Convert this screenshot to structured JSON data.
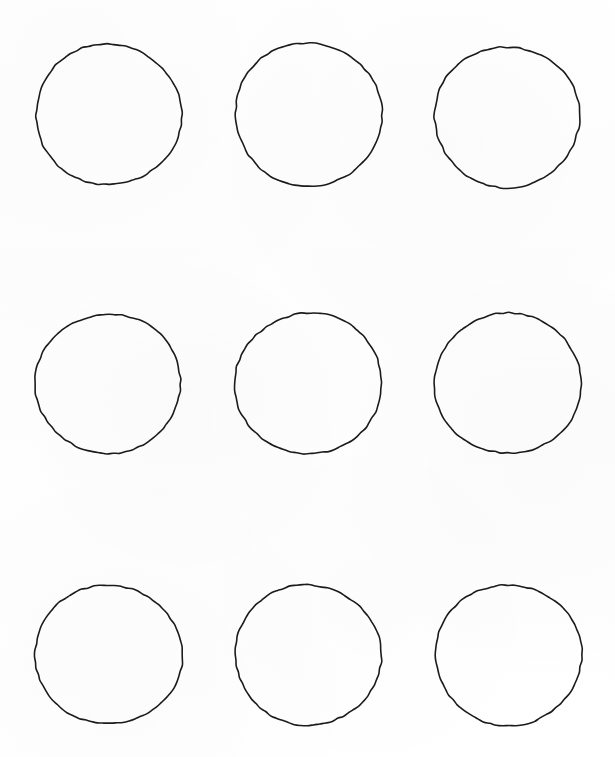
{
  "document": {
    "kind": "circle-grid-worksheet",
    "page_width": 615,
    "page_height": 757,
    "background_color": "#ffffff",
    "ink_color": "#1b1b1b",
    "stroke_width_px": 1.6,
    "rows": 3,
    "columns": 3,
    "shape_count": 9,
    "shape_type": "circle-outline",
    "text_content": ""
  },
  "grid": {
    "column_centers_x": [
      108,
      308,
      507
    ],
    "row_centers_y": [
      114,
      383,
      654
    ],
    "nominal_diameter_x": 146,
    "nominal_diameter_y": 142,
    "column_gap_px": 54,
    "row_gap_px": 128
  },
  "shapes": [
    {
      "id": "circle-r1c1",
      "row": 1,
      "column": 1,
      "cx": 108,
      "cy": 114,
      "rx": 72.5,
      "ry": 70.5,
      "rotation": -1.2
    },
    {
      "id": "circle-r1c2",
      "row": 1,
      "column": 2,
      "cx": 308,
      "cy": 114,
      "rx": 73.5,
      "ry": 71.5,
      "rotation": 0.8
    },
    {
      "id": "circle-r1c3",
      "row": 1,
      "column": 3,
      "cx": 507,
      "cy": 117,
      "rx": 73.0,
      "ry": 70.0,
      "rotation": -0.6
    },
    {
      "id": "circle-r2c1",
      "row": 2,
      "column": 1,
      "cx": 108,
      "cy": 383,
      "rx": 73.0,
      "ry": 69.5,
      "rotation": 1.0
    },
    {
      "id": "circle-r2c2",
      "row": 2,
      "column": 2,
      "cx": 308,
      "cy": 383,
      "rx": 73.5,
      "ry": 70.5,
      "rotation": -0.9
    },
    {
      "id": "circle-r2c3",
      "row": 2,
      "column": 3,
      "cx": 508,
      "cy": 383,
      "rx": 73.0,
      "ry": 70.5,
      "rotation": 0.5
    },
    {
      "id": "circle-r3c1",
      "row": 3,
      "column": 1,
      "cx": 108,
      "cy": 654,
      "rx": 73.5,
      "ry": 69.5,
      "rotation": -1.4
    },
    {
      "id": "circle-r3c2",
      "row": 3,
      "column": 2,
      "cx": 308,
      "cy": 655,
      "rx": 73.0,
      "ry": 70.0,
      "rotation": 0.7
    },
    {
      "id": "circle-r3c3",
      "row": 3,
      "column": 3,
      "cx": 508,
      "cy": 655,
      "rx": 73.5,
      "ry": 70.0,
      "rotation": -0.5
    }
  ]
}
